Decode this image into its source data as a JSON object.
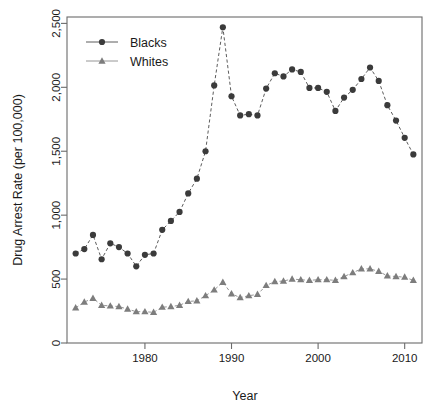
{
  "chart_data": {
    "type": "scatter",
    "title": "",
    "xlabel": "Year",
    "ylabel": "Drug Arrest Rate (per 100,000)",
    "xlim": [
      1971,
      2012
    ],
    "ylim": [
      0,
      2550
    ],
    "grid": false,
    "legend_position": "top-left",
    "xticks": [
      "1980",
      "1990",
      "2000",
      "2010"
    ],
    "xtick_values": [
      1980,
      1990,
      2000,
      2010
    ],
    "yticks": [
      "0",
      "500",
      "1,000",
      "1,500",
      "2,000",
      "2,500"
    ],
    "ytick_values": [
      0,
      500,
      1000,
      1500,
      2000,
      2500
    ],
    "x": [
      1972,
      1973,
      1974,
      1975,
      1976,
      1977,
      1978,
      1979,
      1980,
      1981,
      1982,
      1983,
      1984,
      1985,
      1986,
      1987,
      1988,
      1989,
      1990,
      1991,
      1992,
      1993,
      1994,
      1995,
      1996,
      1997,
      1998,
      1999,
      2000,
      2001,
      2002,
      2003,
      2004,
      2005,
      2006,
      2007,
      2008,
      2009,
      2010,
      2011
    ],
    "series": [
      {
        "name": "Blacks",
        "marker": "circle",
        "color": "#3b3b3b",
        "values": [
          700,
          735,
          845,
          655,
          780,
          750,
          700,
          600,
          690,
          700,
          885,
          955,
          1025,
          1170,
          1285,
          1500,
          2015,
          2470,
          1930,
          1780,
          1790,
          1780,
          1990,
          2110,
          2085,
          2140,
          2120,
          1995,
          1995,
          1965,
          1815,
          1920,
          1980,
          2065,
          2155,
          2050,
          1860,
          1740,
          1605,
          1475
        ]
      },
      {
        "name": "Whites",
        "marker": "triangle",
        "color": "#7d7d7d",
        "values": [
          275,
          320,
          350,
          295,
          290,
          285,
          265,
          245,
          245,
          240,
          280,
          285,
          295,
          325,
          330,
          370,
          415,
          475,
          385,
          355,
          370,
          380,
          450,
          480,
          485,
          500,
          495,
          490,
          495,
          495,
          490,
          520,
          550,
          580,
          580,
          560,
          525,
          520,
          515,
          490
        ]
      }
    ]
  },
  "legend": {
    "entries": [
      {
        "label": "Blacks"
      },
      {
        "label": "Whites"
      }
    ]
  },
  "axes": {
    "x_title": "Year",
    "y_title": "Drug Arrest Rate (per 100,000)"
  }
}
